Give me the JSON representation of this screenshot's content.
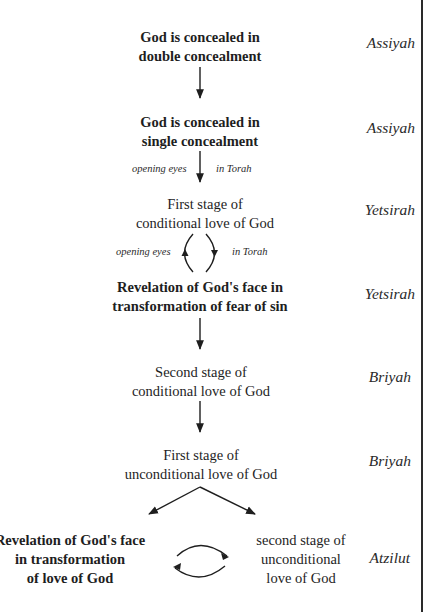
{
  "diagram": {
    "nodes": [
      {
        "id": "n1",
        "bold": true,
        "lines": [
          "God is concealed in",
          "double concealment"
        ],
        "world": "Assiyah"
      },
      {
        "id": "n2",
        "bold": true,
        "lines": [
          "God is concealed in",
          "single concealment"
        ],
        "world": "Assiyah"
      },
      {
        "id": "n3",
        "bold": false,
        "lines": [
          "First stage of",
          "conditional love of God"
        ],
        "world": "Yetsirah"
      },
      {
        "id": "n4",
        "bold": true,
        "lines": [
          "Revelation of God's face in",
          "transformation of fear of sin"
        ],
        "world": "Yetsirah"
      },
      {
        "id": "n5",
        "bold": false,
        "lines": [
          "Second stage of",
          "conditional love of God"
        ],
        "world": "Briyah"
      },
      {
        "id": "n6",
        "bold": false,
        "lines": [
          "First stage of",
          "unconditional love of God"
        ],
        "world": "Briyah"
      },
      {
        "id": "n7",
        "bold": true,
        "lines": [
          "Revelation of God's face",
          "in transformation",
          "of love of God"
        ],
        "world": "Atzilut"
      },
      {
        "id": "n8",
        "bold": false,
        "lines": [
          "second stage of",
          "unconditional",
          "love of God"
        ],
        "world": "Atzilut"
      }
    ],
    "edge_labels": {
      "n2_n3": {
        "left": "opening eyes",
        "right": "in Torah"
      },
      "n3_n4": {
        "left": "opening eyes",
        "right": "in Torah"
      }
    },
    "edges": [
      {
        "from": "n1",
        "to": "n2",
        "type": "down-arrow"
      },
      {
        "from": "n2",
        "to": "n3",
        "type": "down-arrow",
        "label": "opening eyes / in Torah"
      },
      {
        "from": "n3",
        "to": "n4",
        "type": "bidirectional-cycle",
        "label": "opening eyes / in Torah"
      },
      {
        "from": "n4",
        "to": "n5",
        "type": "down-arrow"
      },
      {
        "from": "n5",
        "to": "n6",
        "type": "down-arrow"
      },
      {
        "from": "n6",
        "to": "n7",
        "type": "diagonal-arrow"
      },
      {
        "from": "n6",
        "to": "n8",
        "type": "diagonal-arrow"
      },
      {
        "from": "n7",
        "to": "n8",
        "type": "bidirectional-cycle"
      }
    ],
    "colors": {
      "text": "#1e1e1e",
      "lines": "#2a2a2a",
      "background": "#ffffff"
    }
  }
}
